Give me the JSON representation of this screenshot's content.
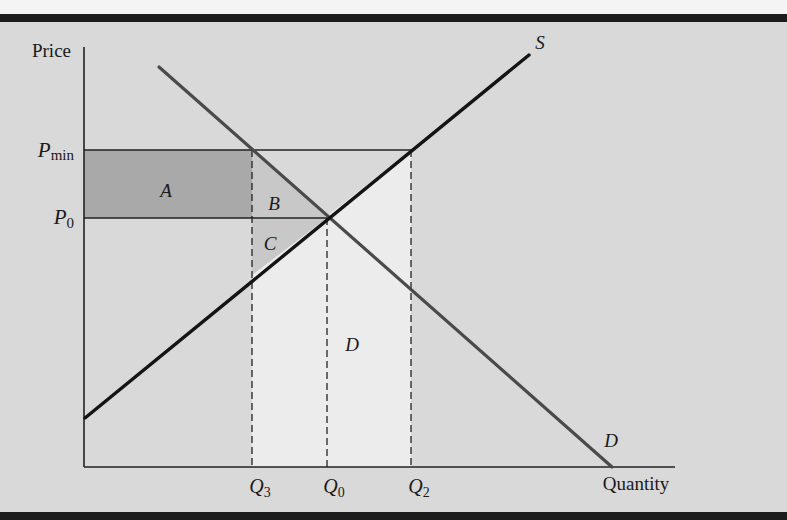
{
  "figure": {
    "axes": {
      "y_label": "Price",
      "x_label": "Quantity"
    },
    "price_levels": [
      {
        "id": "pmin",
        "symbol": "P",
        "subscript": "min"
      },
      {
        "id": "p0",
        "symbol": "P",
        "subscript": "0"
      }
    ],
    "quantity_levels": [
      {
        "id": "q3",
        "symbol": "Q",
        "subscript": "3"
      },
      {
        "id": "q0",
        "symbol": "Q",
        "subscript": "0"
      },
      {
        "id": "q2",
        "symbol": "Q",
        "subscript": "2"
      }
    ],
    "curves": {
      "supply": {
        "label": "S"
      },
      "demand": {
        "label": "D"
      }
    },
    "regions": {
      "a": "A",
      "b": "B",
      "c": "C",
      "d": "D"
    },
    "colors": {
      "background": "#d9d9d9",
      "region_a": "#a9a9a9",
      "region_bc": "#c8c8c8",
      "region_d": "#ececec",
      "supply_line": "#141414",
      "demand_line": "#4a4a4a",
      "axis": "#222222"
    }
  }
}
